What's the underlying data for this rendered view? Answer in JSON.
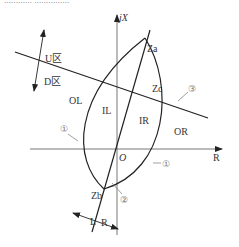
{
  "diagram": {
    "type": "impedance-plane characteristic",
    "axes": {
      "horizontal_label": "R",
      "vertical_label": "jX",
      "origin_label": "O"
    },
    "points": {
      "za": "Za",
      "zb": "Zb",
      "zc": "Zc"
    },
    "regions": {
      "ol": "OL",
      "il": "IL",
      "ir": "IR",
      "or": "OR",
      "u_zone": "U区",
      "d_zone": "D区"
    },
    "direction_labels": {
      "left": "L",
      "right": "R"
    },
    "markers": {
      "one_left": "①",
      "one_right": "①",
      "two": "②",
      "three": "③"
    },
    "clipped_top_text": "…………  ……………"
  }
}
